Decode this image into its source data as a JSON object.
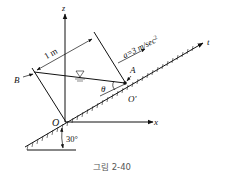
{
  "figure": {
    "caption": "그림 2-40",
    "labels": {
      "z_axis": "z",
      "x_axis": "x",
      "t_axis": "t",
      "origin": "O",
      "origin_prime": "O'",
      "point_a": "A",
      "point_b": "B",
      "width": "1 m",
      "acceleration": "a=3 m/sec",
      "acceleration_exp": "2",
      "angle_theta": "θ",
      "incline_angle": "30°"
    },
    "icons": {
      "free_surface": "free-surface-triangle-icon"
    }
  }
}
